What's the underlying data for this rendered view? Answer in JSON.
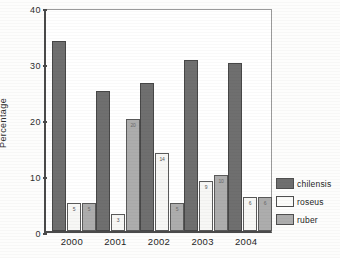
{
  "chart_data": {
    "type": "bar",
    "title": "",
    "xlabel": "",
    "ylabel": "Percentage",
    "categories": [
      "2000",
      "2001",
      "2002",
      "2003",
      "2004"
    ],
    "ylim": [
      0,
      40
    ],
    "yticks": [
      0,
      10,
      20,
      30,
      40
    ],
    "grid": false,
    "legend_position": "right",
    "series": [
      {
        "name": "chilensis",
        "color": "#6f6f6f",
        "values": [
          34,
          25,
          26.5,
          30.5,
          30
        ],
        "labels": [
          "",
          "",
          "",
          "",
          ""
        ]
      },
      {
        "name": "roseus",
        "color": "#f7f7f5",
        "values": [
          5,
          3,
          14,
          9,
          6
        ],
        "labels": [
          "5",
          "3",
          "14",
          "9",
          "6"
        ]
      },
      {
        "name": "ruber",
        "color": "#adadad",
        "values": [
          5,
          20,
          5,
          10,
          6
        ],
        "labels": [
          "5",
          "20",
          "5",
          "10",
          "6"
        ]
      }
    ]
  },
  "legend": {
    "items": [
      {
        "label": "chilensis",
        "swatch": "chilensis"
      },
      {
        "label": "roseus",
        "swatch": "roseus"
      },
      {
        "label": "ruber",
        "swatch": "ruber"
      }
    ]
  },
  "colors": {
    "chilensis": "#6f6f6f",
    "roseus": "#f7f7f5",
    "ruber": "#adadad",
    "axis": "#4a4a4a",
    "text": "#1f1f1f"
  }
}
